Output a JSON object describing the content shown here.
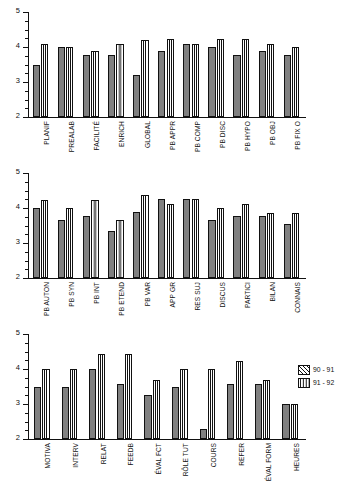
{
  "chart_data": [
    {
      "type": "bar",
      "title": "",
      "xlabel": "",
      "ylabel": "",
      "ylim": [
        2,
        5
      ],
      "yticks": [
        2,
        3,
        4,
        5
      ],
      "yticks_minor": [
        2.25,
        2.5,
        2.75,
        3.25,
        3.5,
        3.75,
        4.25,
        4.5,
        4.75
      ],
      "grid": false,
      "legend_position": "right",
      "categories": [
        "PLANIF",
        "PREALAB",
        "FACILITÉ",
        "ENRICH",
        "GLOBAL",
        "PB APPR",
        "PB COMP",
        "PB DISC",
        "PB HYPO",
        "PB OBJ",
        "PB FIX O"
      ],
      "series": [
        {
          "name": "90 - 91",
          "values": [
            3.5,
            4.0,
            3.78,
            3.78,
            3.2,
            3.88,
            4.1,
            4.0,
            3.78,
            3.88,
            3.78
          ]
        },
        {
          "name": "91 - 92",
          "values": [
            4.1,
            4.0,
            3.88,
            4.1,
            4.2,
            4.22,
            4.1,
            4.22,
            4.22,
            4.1,
            4.0
          ]
        }
      ]
    },
    {
      "type": "bar",
      "title": "",
      "xlabel": "",
      "ylabel": "",
      "ylim": [
        2,
        5
      ],
      "yticks": [
        2,
        3,
        4,
        5
      ],
      "yticks_minor": [
        2.25,
        2.5,
        2.75,
        3.25,
        3.5,
        3.75,
        4.25,
        4.5,
        4.75
      ],
      "grid": false,
      "legend_position": "right",
      "categories": [
        "PB AUTON",
        "PB SYN",
        "PB INT",
        "PB ETEND",
        "PB VAR",
        "APP GR",
        "RES SUJ",
        "DISCUS",
        "PARTICI",
        "BILAN",
        "CONNAIS"
      ],
      "series": [
        {
          "name": "90 - 91",
          "values": [
            4.0,
            3.65,
            3.77,
            3.33,
            3.88,
            4.25,
            4.26,
            3.66,
            3.78,
            3.78,
            3.55
          ]
        },
        {
          "name": "91 - 92",
          "values": [
            4.24,
            4.0,
            4.24,
            3.66,
            4.36,
            4.12,
            4.26,
            4.0,
            4.12,
            3.86,
            3.86
          ]
        }
      ]
    },
    {
      "type": "bar",
      "title": "",
      "xlabel": "",
      "ylabel": "",
      "ylim": [
        2,
        5
      ],
      "yticks": [
        2,
        3,
        4,
        5
      ],
      "yticks_minor": [
        2.25,
        2.5,
        2.75,
        3.25,
        3.5,
        3.75,
        4.25,
        4.5,
        4.75
      ],
      "grid": false,
      "legend_position": "right",
      "categories": [
        "MOTIVA",
        "INTERV",
        "RELAT",
        "FEEDB",
        "ÉVAL FCT",
        "RÔLE TUT",
        "COURS",
        "REFER",
        "ÉVAL FORM",
        "HEURES"
      ],
      "series": [
        {
          "name": "90 - 91",
          "values": [
            3.5,
            3.5,
            4.0,
            3.57,
            3.25,
            3.5,
            2.3,
            3.58,
            3.58,
            3.0
          ]
        },
        {
          "name": "91 - 92",
          "values": [
            4.0,
            4.0,
            4.42,
            4.42,
            3.68,
            4.0,
            4.0,
            4.22,
            3.68,
            3.0
          ]
        }
      ]
    }
  ],
  "legend": {
    "entries": [
      {
        "label": "90 - 91",
        "pattern": "cross-hatch",
        "color": "#808080"
      },
      {
        "label": "91 - 92",
        "pattern": "vertical-stripes",
        "color": "#ffffff"
      }
    ]
  },
  "axis": {
    "y_tick_labels": [
      "5",
      "4",
      "3",
      "2"
    ]
  }
}
